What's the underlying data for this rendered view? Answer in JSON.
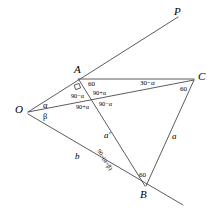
{
  "figure": {
    "type": "geometry-diagram",
    "width": 216,
    "height": 224,
    "stroke_color": "#4a4a4a",
    "text_color": "#000000",
    "background": "#ffffff"
  },
  "vertices": [
    {
      "id": "O",
      "label": "O",
      "x": 28,
      "y": 112
    },
    {
      "id": "A",
      "label": "A",
      "x": 78,
      "y": 78
    },
    {
      "id": "C",
      "label": "C",
      "x": 195,
      "y": 78
    },
    {
      "id": "B",
      "label": "B",
      "x": 145,
      "y": 187
    },
    {
      "id": "P",
      "label": "P",
      "x": 178,
      "y": 14
    }
  ],
  "segments": [
    {
      "name": "ray-O-to-P-through-A",
      "from": "O",
      "to": "P"
    },
    {
      "name": "segment-A-to-C",
      "from": "A",
      "to": "C"
    },
    {
      "name": "segment-O-to-C",
      "from": "O",
      "to": "C"
    },
    {
      "name": "segment-A-to-B",
      "from": "A",
      "to": "B"
    },
    {
      "name": "segment-C-to-B",
      "from": "C",
      "to": "B"
    },
    {
      "name": "ray-O-through-B-extended",
      "from": "O",
      "to": "B-extended"
    }
  ],
  "angle_labels": {
    "at_O": {
      "alpha": "α",
      "beta": "β"
    },
    "at_A": {
      "right_angle_marker": "∟",
      "sixty": "60",
      "ninety_minus_alpha_left": "90−α",
      "ninety_plus_alpha_upper": "90+α",
      "ninety_plus_alpha_lower": "90+α",
      "ninety_minus_alpha_right": "90−α"
    },
    "at_C": {
      "thirty_minus_alpha": "30−α",
      "sixty": "60"
    },
    "at_B": {
      "sixty": "60",
      "ninety_minus_alpha_plus_beta": "90−(α+β)"
    }
  },
  "side_labels": {
    "a_prime": "a′",
    "a": "a",
    "b": "b"
  }
}
